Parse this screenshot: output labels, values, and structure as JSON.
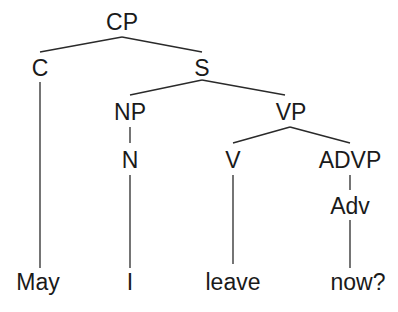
{
  "diagram": {
    "type": "syntax-tree",
    "nodes": [
      {
        "id": "cp",
        "label": "CP",
        "parent": null
      },
      {
        "id": "c",
        "label": "C",
        "parent": "cp"
      },
      {
        "id": "s",
        "label": "S",
        "parent": "cp"
      },
      {
        "id": "np",
        "label": "NP",
        "parent": "s"
      },
      {
        "id": "vp",
        "label": "VP",
        "parent": "s"
      },
      {
        "id": "n",
        "label": "N",
        "parent": "np"
      },
      {
        "id": "v",
        "label": "V",
        "parent": "vp"
      },
      {
        "id": "advp",
        "label": "ADVP",
        "parent": "vp"
      },
      {
        "id": "adv",
        "label": "Adv",
        "parent": "advp"
      },
      {
        "id": "may",
        "label": "May",
        "parent": "c"
      },
      {
        "id": "i",
        "label": "I",
        "parent": "n"
      },
      {
        "id": "leave",
        "label": "leave",
        "parent": "v"
      },
      {
        "id": "now",
        "label": "now?",
        "parent": "adv"
      }
    ],
    "sentence": "May I leave now?"
  }
}
